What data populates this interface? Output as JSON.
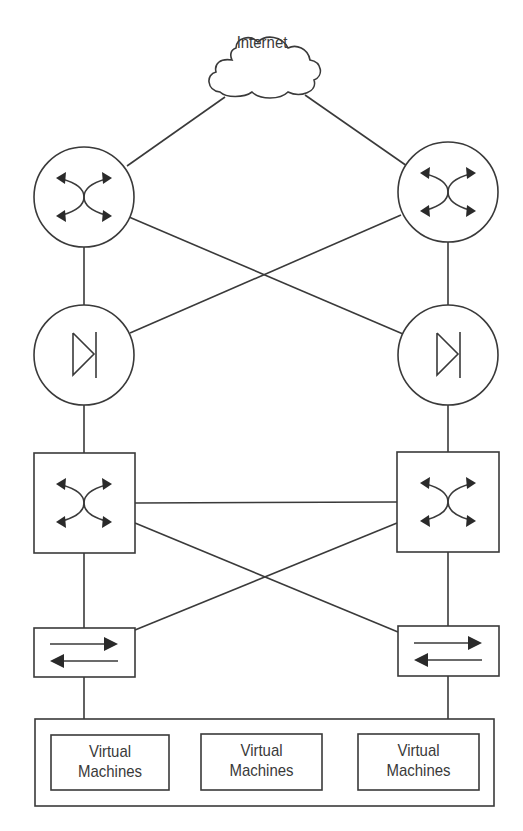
{
  "diagram": {
    "type": "network-topology",
    "nodes": [
      {
        "id": "internet",
        "kind": "cloud",
        "label": "Internet"
      },
      {
        "id": "router-left",
        "kind": "router",
        "label": ""
      },
      {
        "id": "router-right",
        "kind": "router",
        "label": ""
      },
      {
        "id": "firewall-left",
        "kind": "firewall",
        "label": ""
      },
      {
        "id": "firewall-right",
        "kind": "firewall",
        "label": ""
      },
      {
        "id": "core-switch-left",
        "kind": "layer3-switch",
        "label": ""
      },
      {
        "id": "core-switch-right",
        "kind": "layer3-switch",
        "label": ""
      },
      {
        "id": "access-switch-left",
        "kind": "layer2-switch",
        "label": ""
      },
      {
        "id": "access-switch-right",
        "kind": "layer2-switch",
        "label": ""
      },
      {
        "id": "vm-host-group",
        "kind": "container",
        "label": ""
      }
    ],
    "vm_boxes": [
      {
        "line1": "Virtual",
        "line2": "Machines"
      },
      {
        "line1": "Virtual",
        "line2": "Machines"
      },
      {
        "line1": "Virtual",
        "line2": "Machines"
      }
    ],
    "edges": [
      [
        "internet",
        "router-left"
      ],
      [
        "internet",
        "router-right"
      ],
      [
        "router-left",
        "firewall-left"
      ],
      [
        "router-right",
        "firewall-right"
      ],
      [
        "router-left",
        "firewall-right"
      ],
      [
        "router-right",
        "firewall-left"
      ],
      [
        "firewall-left",
        "core-switch-left"
      ],
      [
        "firewall-right",
        "core-switch-right"
      ],
      [
        "core-switch-left",
        "core-switch-right"
      ],
      [
        "core-switch-left",
        "access-switch-left"
      ],
      [
        "core-switch-right",
        "access-switch-right"
      ],
      [
        "core-switch-left",
        "access-switch-right"
      ],
      [
        "core-switch-right",
        "access-switch-left"
      ],
      [
        "access-switch-left",
        "vm-host-group"
      ],
      [
        "access-switch-right",
        "vm-host-group"
      ]
    ]
  },
  "cloud": {
    "label": "Internet"
  },
  "colors": {
    "stroke": "#3a3a3a",
    "background": "#ffffff"
  }
}
